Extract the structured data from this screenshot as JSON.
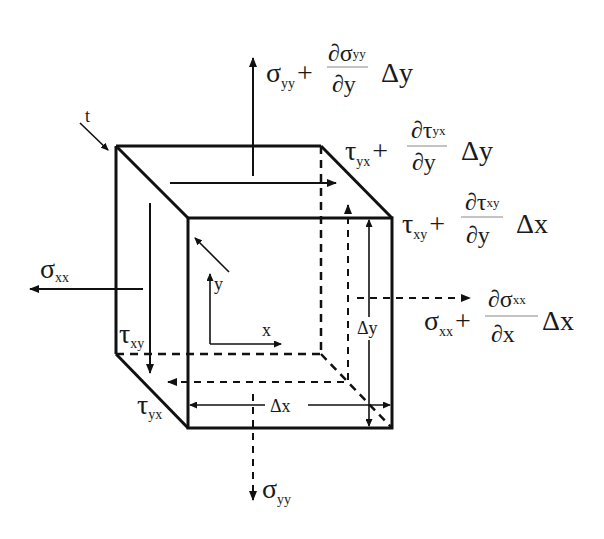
{
  "diagram": {
    "type": "stress-element-3d",
    "colors": {
      "stroke": "#111111",
      "background": "#ffffff"
    },
    "labels": {
      "top_stress": {
        "base": "σ",
        "sub": "yy",
        "plus": "+",
        "num": "∂σ",
        "num_sub": "yy",
        "den": "∂y",
        "delta": "Δy"
      },
      "top_shear": {
        "base": "τ",
        "sub": "yx",
        "plus": "+",
        "num": "∂τ",
        "num_sub": "yx",
        "den": "∂y",
        "delta": "Δy"
      },
      "right_shear": {
        "base": "τ",
        "sub": "xy",
        "plus": "+",
        "num": "∂τ",
        "num_sub": "xy",
        "den": "∂y",
        "delta": "Δx"
      },
      "right_stress": {
        "base": "σ",
        "sub": "xx",
        "plus": "+",
        "num": "∂σ",
        "num_sub": "xx",
        "den": "∂x",
        "delta": "Δx"
      },
      "left_stress": {
        "base": "σ",
        "sub": "xx"
      },
      "left_shear": {
        "base": "τ",
        "sub": "xy"
      },
      "bottom_shear": {
        "base": "τ",
        "sub": "yx"
      },
      "bottom_stress": {
        "base": "σ",
        "sub": "yy"
      },
      "thickness": "t",
      "axis_x": "x",
      "axis_y": "y",
      "dim_x": "Δx",
      "dim_y": "Δy"
    }
  }
}
